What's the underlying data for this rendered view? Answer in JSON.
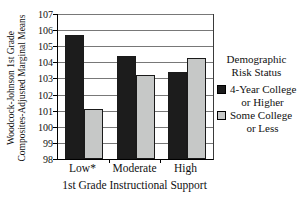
{
  "chart_data": {
    "type": "bar",
    "title": "",
    "categories": [
      "Low*",
      "Moderate",
      "High"
    ],
    "series": [
      {
        "name": "4-Year College or Higher",
        "color": "#1c1c1c",
        "values": [
          105.7,
          104.4,
          103.4
        ]
      },
      {
        "name": "Some College or Less",
        "color": "#c6c8c7",
        "values": [
          101.1,
          103.2,
          104.3
        ]
      }
    ],
    "xlabel": "1st Grade Instructional Support",
    "ylabel": "Woodcock-Johnson 1st Grade Composites-Adjusted Marginal Means",
    "ylabel_lines": [
      "Woodcock-Johnson 1st Grade",
      "Composites-Adjusted Marginal Means"
    ],
    "ylim": [
      98,
      107
    ],
    "yticks": [
      98,
      99,
      100,
      101,
      102,
      103,
      104,
      105,
      106,
      107
    ],
    "grid": true,
    "legend": {
      "position": "right",
      "title_lines": [
        "Demographic",
        "Risk Status"
      ],
      "entries": [
        {
          "label_lines": [
            "4-Year College",
            "or Higher"
          ],
          "color": "#1c1c1c"
        },
        {
          "label_lines": [
            "Some College",
            "or Less"
          ],
          "color": "#c6c8c7"
        }
      ]
    },
    "colors": {
      "axis": "#000000",
      "gridline": "#787878",
      "text": "#111111",
      "background": "#ffffff"
    }
  }
}
